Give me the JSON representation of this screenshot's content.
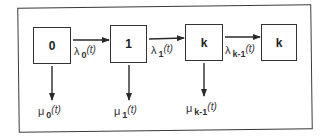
{
  "diagram": {
    "type": "birth-death state transition diagram",
    "states": [
      {
        "id": "s0",
        "label": "0"
      },
      {
        "id": "s1",
        "label": "1"
      },
      {
        "id": "sk",
        "label": "k"
      },
      {
        "id": "sk2",
        "label": "k"
      }
    ],
    "transitions": [
      {
        "from": "s0",
        "to": "s1",
        "symbol": "λ",
        "subscript": "0",
        "arg": "(t)"
      },
      {
        "from": "s1",
        "to": "sk",
        "symbol": "λ",
        "subscript": "1",
        "arg": "(t)"
      },
      {
        "from": "sk",
        "to": "sk2",
        "symbol": "λ",
        "subscript": "k-1",
        "arg": "(t)"
      }
    ],
    "exits": [
      {
        "from": "s0",
        "symbol": "μ",
        "subscript": "0",
        "arg": "(t)"
      },
      {
        "from": "s1",
        "symbol": "μ",
        "subscript": "1",
        "arg": "(t)"
      },
      {
        "from": "sk",
        "symbol": "μ",
        "subscript": "k-1",
        "arg": "(t)"
      }
    ]
  },
  "colors": {
    "line": "#333333",
    "background": "#ffffff"
  }
}
